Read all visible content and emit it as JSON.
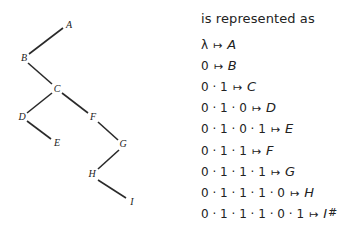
{
  "caption": "is represented as",
  "tree": {
    "nodes": [
      {
        "label": "A",
        "x": 68,
        "y": 25
      },
      {
        "label": "B",
        "x": 24,
        "y": 58
      },
      {
        "label": "C",
        "x": 57,
        "y": 89
      },
      {
        "label": "D",
        "x": 22,
        "y": 117
      },
      {
        "label": "E",
        "x": 57,
        "y": 143
      },
      {
        "label": "F",
        "x": 93,
        "y": 117
      },
      {
        "label": "G",
        "x": 123,
        "y": 144
      },
      {
        "label": "H",
        "x": 92,
        "y": 174
      },
      {
        "label": "I",
        "x": 132,
        "y": 202
      }
    ],
    "edges": [
      {
        "from": "A",
        "to": "B"
      },
      {
        "from": "B",
        "to": "C"
      },
      {
        "from": "C",
        "to": "D"
      },
      {
        "from": "D",
        "to": "E"
      },
      {
        "from": "C",
        "to": "F"
      },
      {
        "from": "F",
        "to": "G"
      },
      {
        "from": "G",
        "to": "H"
      },
      {
        "from": "H",
        "to": "I"
      }
    ]
  },
  "mappings": [
    {
      "path": "λ",
      "arrow": "↦",
      "target": "A"
    },
    {
      "path": "0",
      "arrow": "↦",
      "target": "B"
    },
    {
      "path": "0 · 1",
      "arrow": "↦",
      "target": "C"
    },
    {
      "path": "0 · 1 · 0",
      "arrow": "↦",
      "target": "D"
    },
    {
      "path": "0 · 1 · 0 · 1",
      "arrow": "↦",
      "target": "E"
    },
    {
      "path": "0 · 1 · 1",
      "arrow": "↦",
      "target": "F"
    },
    {
      "path": "0 · 1 · 1 · 1",
      "arrow": "↦",
      "target": "G"
    },
    {
      "path": "0 · 1 · 1 · 1 · 0",
      "arrow": "↦",
      "target": "H"
    },
    {
      "path": "0 · 1 · 1 · 1 · 0 · 1",
      "arrow": "↦",
      "target": "I"
    }
  ],
  "end_mark": "#"
}
